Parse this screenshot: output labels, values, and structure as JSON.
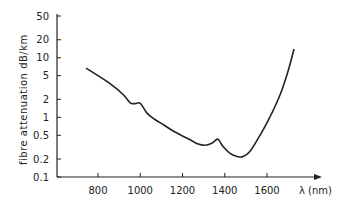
{
  "chart_data": {
    "type": "line",
    "title": "",
    "xlabel": "λ (nm)",
    "ylabel": "fibre attenuation   dB/km",
    "yscale": "log",
    "xlim": [
      690,
      1760
    ],
    "ylim": [
      0.1,
      50
    ],
    "grid": false,
    "legend": null,
    "x_ticks": [
      800,
      1000,
      1200,
      1400,
      1600
    ],
    "x_tick_labels": [
      "800",
      "1000",
      "1200",
      "1400",
      "1600"
    ],
    "y_ticks": [
      0.1,
      0.2,
      0.5,
      1,
      2,
      5,
      10,
      20,
      50
    ],
    "y_tick_labels": [
      "0.1",
      "0.2",
      "0.5",
      "1",
      "2",
      "5",
      "10",
      "20",
      "50"
    ],
    "series": [
      {
        "name": "fibre attenuation",
        "x": [
          743,
          800,
          860,
          920,
          952,
          975,
          1000,
          1030,
          1060,
          1110,
          1160,
          1236,
          1270,
          1307,
          1340,
          1368,
          1390,
          1425,
          1460,
          1487,
          1520,
          1567,
          1610,
          1662,
          1700,
          1728
        ],
        "y": [
          6.7,
          5.0,
          3.6,
          2.4,
          1.75,
          1.7,
          1.72,
          1.2,
          0.97,
          0.75,
          0.58,
          0.42,
          0.36,
          0.34,
          0.37,
          0.43,
          0.33,
          0.25,
          0.22,
          0.22,
          0.27,
          0.5,
          0.95,
          2.4,
          6.0,
          14.0
        ]
      }
    ]
  },
  "axes": {
    "x_label": "λ (nm)",
    "y_label": "fibre attenuation   dB/km"
  }
}
